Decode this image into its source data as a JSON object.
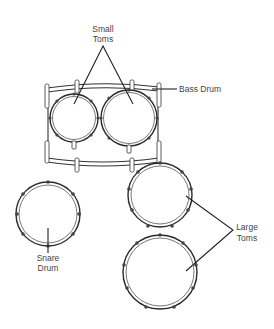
{
  "diagram": {
    "labels": {
      "small_toms": [
        "Small",
        "Toms"
      ],
      "bass_drum": "Bass Drum",
      "snare_drum": [
        "Snare",
        "Drum"
      ],
      "large_toms": [
        "Large",
        "Toms"
      ]
    },
    "components": [
      {
        "name": "Bass Drum",
        "shape": "rectangle-shell (top view)"
      },
      {
        "name": "Small Tom 1",
        "shape": "circle"
      },
      {
        "name": "Small Tom 2",
        "shape": "circle"
      },
      {
        "name": "Snare Drum",
        "shape": "circle"
      },
      {
        "name": "Large Tom 1",
        "shape": "circle"
      },
      {
        "name": "Large Tom 2",
        "shape": "circle"
      }
    ],
    "colors": {
      "line": "#222222",
      "text": "#444444",
      "background": "#ffffff"
    }
  }
}
